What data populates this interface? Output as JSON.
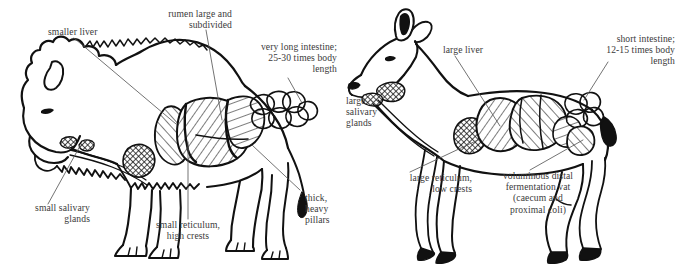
{
  "figure": {
    "type": "comparative-anatomy-diagram",
    "background_color": "#ffffff",
    "ink_color": "#111111",
    "text_color": "#3a3a3a",
    "panels": [
      {
        "id": "bison",
        "animal": "bison",
        "feeding_type": "grazer",
        "side": "left"
      },
      {
        "id": "deer",
        "animal": "deer",
        "feeding_type": "browser",
        "side": "right"
      }
    ]
  },
  "labels": {
    "bison": {
      "smaller_liver": "smaller liver",
      "rumen": "rumen large and\nsubdivided",
      "intestine": "very long intestine;\n25-30 times body\nlength",
      "salivary": "small salivary\nglands",
      "reticulum": "small reticulum,\nhigh crests",
      "pillars": "thick,\nheavy\npillars"
    },
    "deer": {
      "large_liver": "large liver",
      "intestine": "short intestine;\n12-15 times body\nlength",
      "salivary": "large\nsalivary\nglands",
      "reticulum": "large reticulum,\nlow crests",
      "vat": "voluminous distal\nfermentation vat\n(caecum and\nproximal coli)"
    }
  }
}
